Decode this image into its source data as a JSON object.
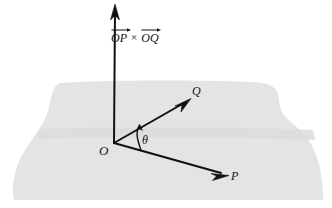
{
  "figure": {
    "kind": "vector-cross-product-diagram",
    "background_color": "#ffffff",
    "ink_color": "#111111",
    "plane": {
      "name": "shaded-plane",
      "fill_color": "#e4e4e4",
      "shading_band_color": "#dcdcdc",
      "description": "horizontal grey plane with wavy torn left and right edges"
    },
    "labels": {
      "origin": "O",
      "vector_p_endpoint": "P",
      "vector_q_endpoint": "Q",
      "angle": "θ",
      "cross_left_term": "OP",
      "cross_operator": "×",
      "cross_right_term": "OQ"
    },
    "vectors": [
      {
        "name": "cross-product-vector",
        "label": "OP × OQ",
        "from": [
          114,
          143
        ],
        "to": [
          115,
          5
        ],
        "direction": "vertical-up-normal-to-plane"
      },
      {
        "name": "vector-op",
        "label": "P",
        "from": [
          114,
          143
        ],
        "to": [
          228,
          175
        ],
        "direction": "down-right-in-plane"
      },
      {
        "name": "vector-oq",
        "label": "Q",
        "from": [
          114,
          143
        ],
        "to": [
          190,
          99
        ],
        "direction": "up-right-in-plane"
      }
    ],
    "angle_arc": {
      "name": "theta-arc",
      "between": [
        "vector-op",
        "vector-oq"
      ],
      "label": "θ",
      "vertex": [
        114,
        143
      ]
    }
  }
}
